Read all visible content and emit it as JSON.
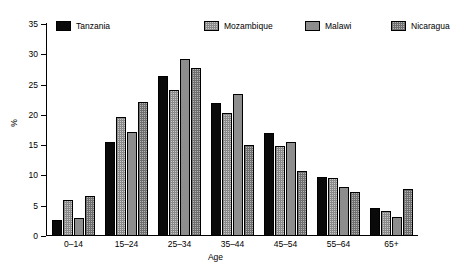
{
  "chart_data": {
    "type": "bar",
    "title": "",
    "xlabel": "Age",
    "ylabel": "%",
    "ylim": [
      0,
      35
    ],
    "yticks": [
      0,
      5,
      10,
      15,
      20,
      25,
      30,
      35
    ],
    "grid": false,
    "legend_position": "top",
    "categories": [
      "0–14",
      "15–24",
      "25–34",
      "35–44",
      "45–54",
      "55–64",
      "65+"
    ],
    "series": [
      {
        "name": "Tanzania",
        "color": "#0a0a0a",
        "pattern": "solid-black",
        "values": [
          2.7,
          15.6,
          26.4,
          22.0,
          17.0,
          9.7,
          4.6
        ]
      },
      {
        "name": "Mozambique",
        "color": "#c9c9c9",
        "pattern": "light-crosshatch",
        "values": [
          5.9,
          19.6,
          24.1,
          20.3,
          14.9,
          9.5,
          4.1
        ]
      },
      {
        "name": "Malawi",
        "color": "#8d8d8d",
        "pattern": "solid-gray",
        "values": [
          2.9,
          17.1,
          29.2,
          23.4,
          15.6,
          8.1,
          3.2
        ]
      },
      {
        "name": "Nicaragua",
        "color": "#b4b4b4",
        "pattern": "dark-crosshatch",
        "values": [
          6.6,
          22.2,
          27.7,
          15.0,
          10.8,
          7.2,
          7.8
        ]
      }
    ]
  },
  "legend": {
    "items": [
      {
        "label": "Tanzania"
      },
      {
        "label": "Mozambique"
      },
      {
        "label": "Malawi"
      },
      {
        "label": "Nicaragua"
      }
    ]
  }
}
